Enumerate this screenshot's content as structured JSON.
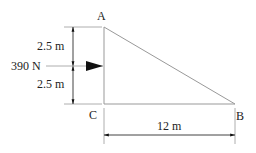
{
  "diagram": {
    "points": {
      "A": "A",
      "B": "B",
      "C": "C"
    },
    "force_label": "390 N",
    "dim_upper": "2.5 m",
    "dim_lower": "2.5 m",
    "dim_base": "12 m",
    "colors": {
      "line": "#999999",
      "arrow": "#111111",
      "text": "#222222"
    }
  }
}
